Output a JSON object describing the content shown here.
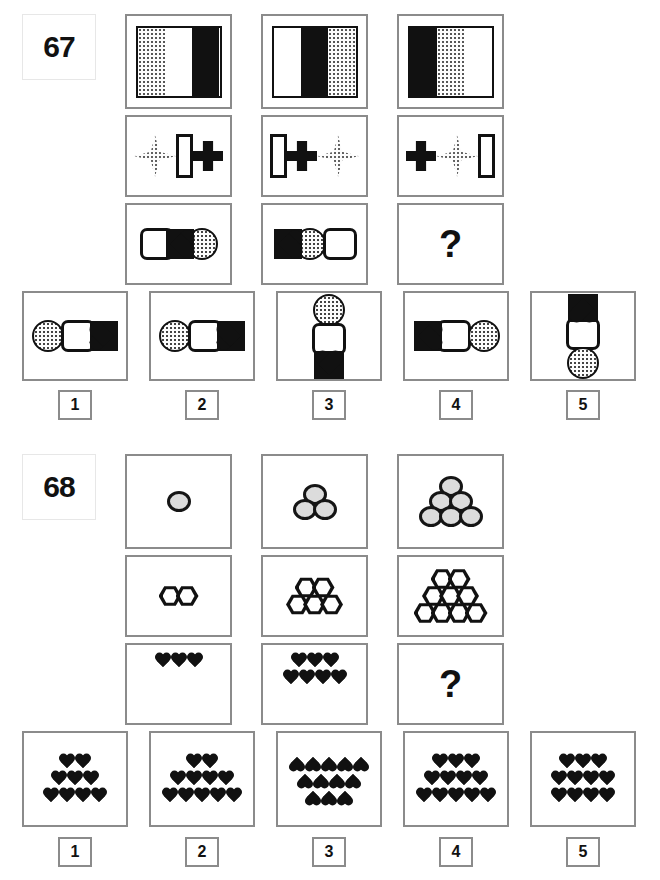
{
  "page": {
    "background": "#ffffff",
    "border_color": "#8b8b8b",
    "ink_color": "#111111",
    "question_mark": "?"
  },
  "puzzles": [
    {
      "id": "67",
      "label": "67",
      "matrix": {
        "rows": [
          {
            "kind": "flag",
            "cells": [
              {
                "stripes": [
                  "dotted",
                  "white",
                  "black"
                ]
              },
              {
                "stripes": [
                  "white",
                  "black",
                  "dotted"
                ]
              },
              {
                "stripes": [
                  "black",
                  "dotted",
                  "white"
                ]
              }
            ]
          },
          {
            "kind": "shapes-row",
            "cells": [
              {
                "shapes": [
                  "diamond-dotted",
                  "rect-white",
                  "cross-black"
                ]
              },
              {
                "shapes": [
                  "rect-white",
                  "cross-black",
                  "diamond-dotted"
                ]
              },
              {
                "shapes": [
                  "cross-black",
                  "diamond-dotted",
                  "rect-white"
                ]
              }
            ]
          },
          {
            "kind": "shapes-row",
            "cells": [
              {
                "shapes": [
                  "square-white",
                  "heart-black-left",
                  "circle-dotted"
                ]
              },
              {
                "shapes": [
                  "heart-black-left",
                  "circle-dotted",
                  "square-white"
                ]
              },
              {
                "shapes": [
                  "question"
                ]
              }
            ]
          }
        ]
      },
      "options": [
        {
          "number": "1",
          "layout": "horizontal",
          "shapes": [
            "circle-dotted",
            "square-white",
            "heart-black-right"
          ]
        },
        {
          "number": "2",
          "layout": "horizontal",
          "shapes": [
            "circle-dotted",
            "square-white",
            "heart-black-right"
          ]
        },
        {
          "number": "3",
          "layout": "vertical",
          "shapes": [
            "circle-dotted",
            "square-white",
            "heart-black-down"
          ]
        },
        {
          "number": "4",
          "layout": "horizontal",
          "shapes": [
            "heart-black-left",
            "square-white",
            "circle-dotted"
          ]
        },
        {
          "number": "5",
          "layout": "vertical",
          "shapes": [
            "heart-black-up",
            "square-white",
            "circle-dotted"
          ]
        }
      ]
    },
    {
      "id": "68",
      "label": "68",
      "matrix": {
        "rows": [
          {
            "kind": "circles",
            "cells": [
              {
                "pyramid": [
                  1
                ],
                "total": 1
              },
              {
                "pyramid": [
                  1,
                  2
                ],
                "total": 3
              },
              {
                "pyramid": [
                  1,
                  2,
                  3
                ],
                "total": 6
              }
            ]
          },
          {
            "kind": "hexagons",
            "cells": [
              {
                "pyramid": [
                  2
                ],
                "total": 2
              },
              {
                "pyramid": [
                  2,
                  3
                ],
                "total": 5
              },
              {
                "pyramid": [
                  2,
                  3,
                  4
                ],
                "total": 9
              }
            ]
          },
          {
            "kind": "hearts",
            "cells": [
              {
                "pyramid": [
                  3
                ],
                "total": 3
              },
              {
                "pyramid": [
                  3,
                  4
                ],
                "total": 7
              },
              {
                "pyramid": [],
                "total": 0,
                "question": true
              }
            ]
          }
        ]
      },
      "options": [
        {
          "number": "1",
          "pyramid": [
            2,
            3,
            4
          ],
          "total": 9,
          "inverted": false
        },
        {
          "number": "2",
          "pyramid": [
            2,
            4,
            5
          ],
          "total": 11,
          "inverted": false
        },
        {
          "number": "3",
          "pyramid": [
            5,
            4,
            3
          ],
          "total": 12,
          "inverted": true
        },
        {
          "number": "4",
          "pyramid": [
            3,
            4,
            5
          ],
          "total": 12,
          "inverted": false
        },
        {
          "number": "5",
          "pyramid": [
            3,
            4,
            4
          ],
          "total": 11,
          "inverted": false
        }
      ]
    }
  ]
}
